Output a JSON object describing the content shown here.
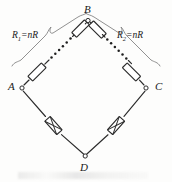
{
  "figure": {
    "type": "circuit-diagram",
    "background_color": "#fdfdfc",
    "line_color": "#2b2b2b",
    "brace_color": "#7d7d7d"
  },
  "vertices": [
    {
      "id": "B",
      "label": "B",
      "x": 88,
      "y": 23,
      "label_x": 84,
      "label_y": 6
    },
    {
      "id": "A",
      "label": "A",
      "x": 22,
      "y": 88,
      "label_x": 8,
      "label_y": 82
    },
    {
      "id": "C",
      "label": "C",
      "x": 146,
      "y": 88,
      "label_x": 155,
      "label_y": 82
    },
    {
      "id": "D",
      "label": "D",
      "x": 85,
      "y": 156,
      "label_x": 80,
      "label_y": 163
    }
  ],
  "branch_labels": [
    {
      "id": "R1",
      "base": "R",
      "sub": "1",
      "rest": "=nR",
      "text": "R1=nR",
      "x": 12,
      "y": 33
    },
    {
      "id": "R2",
      "base": "R",
      "sub": "2",
      "rest": "=nR",
      "text": "R2=nR",
      "x": 117,
      "y": 33
    }
  ],
  "components": {
    "upper_left_arm": {
      "from": "A",
      "to": "B",
      "label": "R1=nR",
      "resistor_count_shown": 2,
      "ellipsis_dots": 6,
      "note": "n identical resistors of value R in series"
    },
    "upper_right_arm": {
      "from": "B",
      "to": "C",
      "label": "R2=nR",
      "resistor_count_shown": 2,
      "ellipsis_dots": 6,
      "note": "n identical resistors of value R in series"
    },
    "lower_left_arm": {
      "from": "A",
      "to": "D",
      "resistor_count_shown": 1,
      "style": "crossed-rectangle"
    },
    "lower_right_arm": {
      "from": "D",
      "to": "C",
      "resistor_count_shown": 1,
      "style": "crossed-rectangle"
    }
  }
}
